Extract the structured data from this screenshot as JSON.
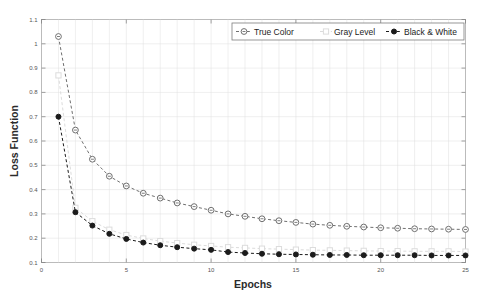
{
  "chart_data": {
    "type": "line",
    "title": "",
    "xlabel": "Epochs",
    "ylabel": "Loss Function",
    "xlim": [
      0,
      25
    ],
    "ylim": [
      0.1,
      1.1
    ],
    "xticks": [
      0,
      5,
      10,
      15,
      20,
      25
    ],
    "xtick_labels": [
      "0",
      "5",
      "10",
      "15",
      "20",
      "25"
    ],
    "yticks": [
      0.1,
      0.2,
      0.3,
      0.4,
      0.5,
      0.6,
      0.7,
      0.8,
      0.9,
      1.0,
      1.1
    ],
    "ytick_labels": [
      "0.1",
      "0.2",
      "0.3",
      "0.4",
      "0.5",
      "0.6",
      "0.7",
      "0.8",
      "0.9",
      "1",
      "1.1"
    ],
    "grid": true,
    "legend_position": "top-right",
    "x": [
      1,
      2,
      3,
      4,
      5,
      6,
      7,
      8,
      9,
      10,
      11,
      12,
      13,
      14,
      15,
      16,
      17,
      18,
      19,
      20,
      21,
      22,
      23,
      24,
      25
    ],
    "series": [
      {
        "name": "True Color",
        "color": "#6f6f6f",
        "marker": "circle-open",
        "linestyle": "dashed",
        "values": [
          1.03,
          0.645,
          0.525,
          0.455,
          0.415,
          0.385,
          0.365,
          0.345,
          0.33,
          0.315,
          0.3,
          0.29,
          0.28,
          0.272,
          0.265,
          0.258,
          0.253,
          0.249,
          0.246,
          0.243,
          0.241,
          0.239,
          0.238,
          0.237,
          0.236
        ]
      },
      {
        "name": "Gray Level",
        "color": "#dcdcdc",
        "marker": "square-open",
        "linestyle": "dashed",
        "values": [
          0.87,
          0.325,
          0.27,
          0.235,
          0.213,
          0.199,
          0.188,
          0.18,
          0.173,
          0.168,
          0.163,
          0.16,
          0.157,
          0.155,
          0.153,
          0.151,
          0.15,
          0.149,
          0.148,
          0.147,
          0.147,
          0.146,
          0.146,
          0.146,
          0.145
        ]
      },
      {
        "name": "Black & White",
        "color": "#1b1b1b",
        "marker": "circle-filled",
        "linestyle": "dashed",
        "values": [
          0.7,
          0.307,
          0.252,
          0.218,
          0.197,
          0.182,
          0.171,
          0.163,
          0.157,
          0.152,
          0.143,
          0.139,
          0.136,
          0.134,
          0.133,
          0.132,
          0.131,
          0.131,
          0.13,
          0.13,
          0.13,
          0.13,
          0.129,
          0.129,
          0.129
        ]
      }
    ]
  },
  "legend": {
    "entries": [
      {
        "label": "True Color"
      },
      {
        "label": "Gray Level"
      },
      {
        "label": "Black & White"
      }
    ]
  }
}
